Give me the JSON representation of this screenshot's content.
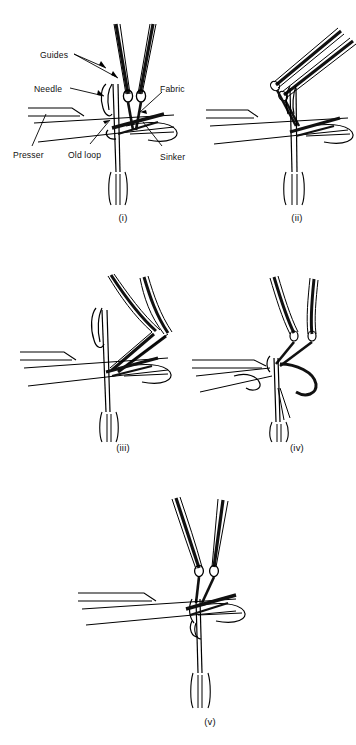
{
  "figure": {
    "line_color": "#000000",
    "fill_dark": "#111111",
    "background": "#ffffff"
  },
  "callouts": [
    {
      "id": "guides",
      "label": "Guides",
      "x": 40,
      "y": 50
    },
    {
      "id": "needle",
      "label": "Needle",
      "x": 34,
      "y": 84
    },
    {
      "id": "fabric",
      "label": "Fabric",
      "x": 160,
      "y": 84
    },
    {
      "id": "presser",
      "label": "Presser",
      "x": 13,
      "y": 150
    },
    {
      "id": "old-loop",
      "label": "Old  loop",
      "x": 68,
      "y": 150
    },
    {
      "id": "sinker",
      "label": "Sinker",
      "x": 160,
      "y": 152
    }
  ],
  "panels": [
    {
      "id": "i",
      "caption": "(i)",
      "caption_x": 103,
      "caption_y": 212,
      "stage": "Guides in front, needle up, old loop on stem"
    },
    {
      "id": "ii",
      "caption": "(ii)",
      "caption_x": 277,
      "caption_y": 212,
      "stage": "Guides swing through to the back"
    },
    {
      "id": "iii",
      "caption": "(iii)",
      "caption_x": 103,
      "caption_y": 442,
      "stage": "Guides overlap and return"
    },
    {
      "id": "iv",
      "caption": "(iv)",
      "caption_x": 277,
      "caption_y": 442,
      "stage": "Needle descends, presser closes beard"
    },
    {
      "id": "v",
      "caption": "(v)",
      "caption_x": 190,
      "caption_y": 716,
      "stage": "Knock-over, new loop drawn through"
    }
  ]
}
